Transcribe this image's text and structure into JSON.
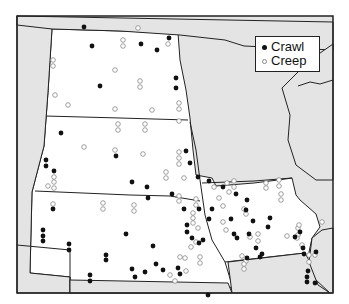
{
  "legend": {
    "items": [
      {
        "label": "Crawl",
        "symbol": "filled-dot"
      },
      {
        "label": "Creep",
        "symbol": "open-circle"
      }
    ]
  },
  "colors": {
    "land_focus": "#ffffff",
    "land_other": "#e6e6e6",
    "border": "#222222",
    "crawl": "#111111",
    "creep": "#888888"
  },
  "points": {
    "crawl": [
      [
        84,
        27
      ],
      [
        92,
        46
      ],
      [
        141,
        44
      ],
      [
        157,
        50
      ],
      [
        169,
        38
      ],
      [
        176,
        78
      ],
      [
        176,
        88
      ],
      [
        100,
        86
      ],
      [
        61,
        133
      ],
      [
        46,
        160
      ],
      [
        46,
        166
      ],
      [
        54,
        171
      ],
      [
        116,
        156
      ],
      [
        186,
        151
      ],
      [
        190,
        163
      ],
      [
        172,
        194
      ],
      [
        132,
        182
      ],
      [
        147,
        187
      ],
      [
        148,
        198
      ],
      [
        53,
        209
      ],
      [
        43,
        230
      ],
      [
        43,
        236
      ],
      [
        43,
        241
      ],
      [
        69,
        244
      ],
      [
        69,
        250
      ],
      [
        126,
        234
      ],
      [
        106,
        255
      ],
      [
        106,
        260
      ],
      [
        90,
        275
      ],
      [
        90,
        281
      ],
      [
        153,
        246
      ],
      [
        156,
        264
      ],
      [
        132,
        269
      ],
      [
        135,
        277
      ],
      [
        145,
        272
      ],
      [
        163,
        270
      ],
      [
        178,
        268
      ],
      [
        180,
        274
      ],
      [
        184,
        209
      ],
      [
        187,
        225
      ],
      [
        187,
        232
      ],
      [
        199,
        209
      ],
      [
        209,
        219
      ],
      [
        192,
        238
      ],
      [
        199,
        243
      ],
      [
        203,
        240
      ],
      [
        208,
        295
      ],
      [
        223,
        187
      ],
      [
        231,
        219
      ],
      [
        236,
        194
      ],
      [
        234,
        234
      ],
      [
        237,
        238
      ],
      [
        246,
        210
      ],
      [
        247,
        200
      ],
      [
        249,
        234
      ],
      [
        253,
        221
      ],
      [
        256,
        248
      ],
      [
        247,
        258
      ],
      [
        270,
        218
      ],
      [
        268,
        227
      ],
      [
        262,
        254
      ],
      [
        260,
        257
      ],
      [
        295,
        237
      ],
      [
        300,
        232
      ],
      [
        303,
        248
      ],
      [
        304,
        254
      ],
      [
        308,
        271
      ],
      [
        307,
        277
      ],
      [
        307,
        282
      ],
      [
        316,
        252
      ],
      [
        315,
        283
      ],
      [
        198,
        177
      ],
      [
        212,
        209
      ],
      [
        209,
        181
      ]
    ],
    "creep": [
      [
        138,
        28
      ],
      [
        123,
        40
      ],
      [
        123,
        46
      ],
      [
        168,
        44
      ],
      [
        53,
        60
      ],
      [
        53,
        66
      ],
      [
        115,
        70
      ],
      [
        140,
        81
      ],
      [
        140,
        87
      ],
      [
        55,
        95
      ],
      [
        68,
        105
      ],
      [
        115,
        109
      ],
      [
        152,
        110
      ],
      [
        179,
        103
      ],
      [
        179,
        109
      ],
      [
        118,
        124
      ],
      [
        118,
        130
      ],
      [
        145,
        124
      ],
      [
        145,
        130
      ],
      [
        179,
        121
      ],
      [
        115,
        150
      ],
      [
        84,
        147
      ],
      [
        143,
        154
      ],
      [
        179,
        152
      ],
      [
        179,
        158
      ],
      [
        179,
        164
      ],
      [
        166,
        172
      ],
      [
        166,
        178
      ],
      [
        184,
        178
      ],
      [
        179,
        196
      ],
      [
        179,
        201
      ],
      [
        48,
        186
      ],
      [
        54,
        177
      ],
      [
        54,
        182
      ],
      [
        54,
        188
      ],
      [
        53,
        204
      ],
      [
        103,
        203
      ],
      [
        103,
        209
      ],
      [
        134,
        205
      ],
      [
        134,
        211
      ],
      [
        196,
        199
      ],
      [
        196,
        205
      ],
      [
        193,
        213
      ],
      [
        193,
        218
      ],
      [
        193,
        223
      ],
      [
        198,
        228
      ],
      [
        191,
        247
      ],
      [
        196,
        242
      ],
      [
        180,
        257
      ],
      [
        185,
        258
      ],
      [
        186,
        271
      ],
      [
        170,
        275
      ],
      [
        175,
        281
      ],
      [
        200,
        257
      ],
      [
        200,
        263
      ],
      [
        227,
        183
      ],
      [
        229,
        192
      ],
      [
        214,
        187
      ],
      [
        219,
        198
      ],
      [
        234,
        181
      ],
      [
        234,
        187
      ],
      [
        244,
        209
      ],
      [
        246,
        214
      ],
      [
        250,
        237
      ],
      [
        242,
        256
      ],
      [
        246,
        261
      ],
      [
        223,
        206
      ],
      [
        226,
        230
      ],
      [
        223,
        222
      ],
      [
        258,
        234
      ],
      [
        258,
        241
      ],
      [
        244,
        269
      ],
      [
        244,
        264
      ],
      [
        266,
        183
      ],
      [
        266,
        188
      ],
      [
        279,
        180
      ],
      [
        279,
        186
      ],
      [
        281,
        194
      ],
      [
        281,
        200
      ],
      [
        298,
        228
      ],
      [
        298,
        235
      ],
      [
        297,
        238
      ],
      [
        309,
        255
      ],
      [
        309,
        262
      ],
      [
        302,
        245
      ],
      [
        287,
        236
      ],
      [
        299,
        225
      ],
      [
        322,
        222
      ],
      [
        315,
        255
      ]
    ]
  }
}
